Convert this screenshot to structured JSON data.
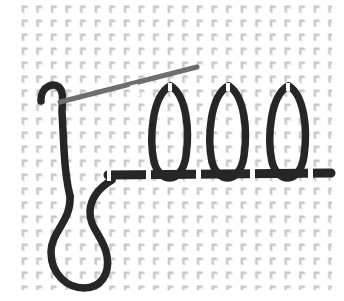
{
  "canvas": {
    "width": 344,
    "height": 301,
    "background_color": "#ffffff",
    "title": "Handwritten stroke figure on patterned paper"
  },
  "paper": {
    "name": "dotted-corner-grid-paper",
    "mark_glyph": "corner-mark",
    "mark_color": "#c9c9c9",
    "mark_shadow_color": "#dcdcdc",
    "tile_width": 14.6,
    "tile_height": 14.0,
    "margin_left": 20,
    "margin_top": 4,
    "area_right": 332,
    "area_bottom": 290,
    "columns": 22,
    "rows": 21
  },
  "ink": {
    "primary_color": "#262626",
    "secondary_color": "#6e6e6e",
    "highlight_color": "#ffffff",
    "primary_width": 7.5,
    "secondary_width": 5.0,
    "baseline_width": 9.0
  },
  "strokes": [
    {
      "name": "top-hook",
      "label": "Top hook and descending spine",
      "color": "#262626",
      "width": 7.5,
      "path": "M 41 101 C 40 86, 56 80, 61 90 C 64 96, 62 103, 62 112 L 64 150 C 65 168, 66 180, 70 196"
    },
    {
      "name": "diagonal-crossbar",
      "label": "Light diagonal cross stroke",
      "color": "#6e6e6e",
      "width": 5.0,
      "path": "M 60 102 L 197 67"
    },
    {
      "name": "descender-loop",
      "label": "Large lower U-shaped descender loop",
      "color": "#262626",
      "width": 7.5,
      "path": "M 70 196 C 72 220, 51 232, 51 252 C 51 275, 68 288, 84 288 C 101 288, 110 274, 107 256 C 104 237, 89 228, 90 211 C 91 196, 102 186, 112 180"
    },
    {
      "name": "loop-1",
      "label": "First tall narrow loop",
      "color": "#262626",
      "width": 7.5,
      "path": "M 170 86 C 152 96, 149 138, 154 162 C 157 173, 164 178, 170 178 C 177 178, 184 170, 186 156 C 190 128, 186 96, 171 86"
    },
    {
      "name": "loop-2",
      "label": "Second tall narrow loop",
      "color": "#262626",
      "width": 7.5,
      "path": "M 228 86 C 210 96, 207 138, 212 162 C 215 173, 222 178, 228 178 C 235 178, 242 170, 244 156 C 248 128, 244 96, 229 86"
    },
    {
      "name": "loop-3",
      "label": "Third tall narrow loop",
      "color": "#262626",
      "width": 7.5,
      "path": "M 288 86 C 270 96, 267 138, 272 162 C 275 173, 282 178, 288 178 C 295 178, 302 170, 304 156 C 308 128, 304 96, 289 86"
    },
    {
      "name": "baseline-bar",
      "label": "Heavy horizontal baseline bar",
      "color": "#262626",
      "width": 9.0,
      "path": "M 108 175 L 331 173"
    }
  ],
  "breaks": [
    {
      "name": "break-diagonal",
      "x": 131,
      "y": 85,
      "width": 5,
      "height": 12,
      "rotate": -14
    },
    {
      "name": "break-diagonal-2",
      "x": 136,
      "y": 84,
      "width": 3,
      "height": 12,
      "rotate": -14
    },
    {
      "name": "break-loop1-top",
      "x": 168,
      "y": 83,
      "width": 4,
      "height": 8,
      "rotate": 0
    },
    {
      "name": "break-loop2-top",
      "x": 226,
      "y": 83,
      "width": 4,
      "height": 8,
      "rotate": 0
    },
    {
      "name": "break-loop3-top",
      "x": 286,
      "y": 83,
      "width": 4,
      "height": 8,
      "rotate": 0
    },
    {
      "name": "break-baseline-1",
      "x": 107,
      "y": 169,
      "width": 4,
      "height": 12,
      "rotate": 0
    },
    {
      "name": "break-baseline-2",
      "x": 146,
      "y": 169,
      "width": 5,
      "height": 12,
      "rotate": 0
    },
    {
      "name": "break-baseline-3",
      "x": 196,
      "y": 169,
      "width": 5,
      "height": 12,
      "rotate": 0
    },
    {
      "name": "break-baseline-4",
      "x": 250,
      "y": 168,
      "width": 5,
      "height": 12,
      "rotate": 0
    },
    {
      "name": "break-baseline-5",
      "x": 308,
      "y": 168,
      "width": 5,
      "height": 12,
      "rotate": 0
    }
  ]
}
